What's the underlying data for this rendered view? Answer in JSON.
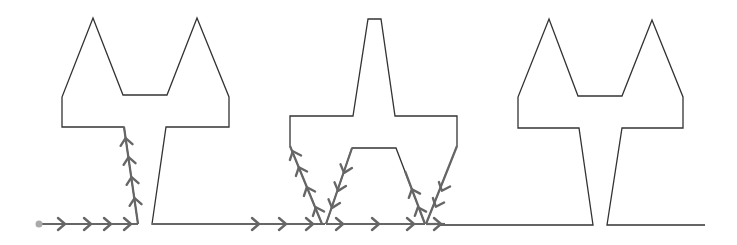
{
  "diagram": {
    "type": "path-through-shapes",
    "colors": {
      "outline": "#333333",
      "path": "#666666",
      "start_dot": "#aaaaaa",
      "background": "#ffffff"
    },
    "start_point": {
      "x": 39,
      "y": 224
    },
    "shapes": [
      {
        "name": "left-eared-shape",
        "points": "138,224 124,127 62,127 62,97 93,18 123,95 167,95 197,18 229,97 229,127 166,127 152,224 325,224"
      },
      {
        "name": "center-spire-shape",
        "points": "322,224 290,146 290,116 353,116 368,19 381,19 395,116 457,116 457,146 426,224",
        "inner": "326,224 352,148 396,148 425,224"
      },
      {
        "name": "right-eared-shape",
        "points": "440,225 593,225 579,128 518,128 518,97 549,19 578,96 622,96 652,20 683,97 683,128 622,128 607,225 705,225"
      }
    ],
    "path_segments": [
      {
        "from": [
          39,
          224
        ],
        "to": [
          138,
          224
        ]
      },
      {
        "from": [
          138,
          224
        ],
        "to": [
          124,
          127
        ]
      },
      {
        "from": [
          152,
          224
        ],
        "to": [
          322,
          224
        ]
      },
      {
        "from": [
          322,
          224
        ],
        "to": [
          290,
          146
        ]
      },
      {
        "from": [
          326,
          224
        ],
        "to": [
          425,
          224
        ]
      },
      {
        "from": [
          352,
          148
        ],
        "to": [
          326,
          224
        ]
      },
      {
        "from": [
          425,
          224
        ],
        "to": [
          405,
          171
        ]
      },
      {
        "from": [
          457,
          146
        ],
        "to": [
          426,
          224
        ]
      },
      {
        "from": [
          426,
          224
        ],
        "to": [
          445,
          224
        ]
      }
    ],
    "arrows": [
      {
        "x": 62,
        "y": 224,
        "angle": 0
      },
      {
        "x": 88,
        "y": 224,
        "angle": 0
      },
      {
        "x": 108,
        "y": 224,
        "angle": 0
      },
      {
        "x": 128,
        "y": 224,
        "angle": 0
      },
      {
        "x": 135,
        "y": 201,
        "angle": -98
      },
      {
        "x": 132,
        "y": 180,
        "angle": -98
      },
      {
        "x": 129,
        "y": 160,
        "angle": -98
      },
      {
        "x": 126,
        "y": 141,
        "angle": -98
      },
      {
        "x": 256,
        "y": 224,
        "angle": 0
      },
      {
        "x": 283,
        "y": 224,
        "angle": 0
      },
      {
        "x": 310,
        "y": 224,
        "angle": 0
      },
      {
        "x": 317,
        "y": 210,
        "angle": -112
      },
      {
        "x": 308,
        "y": 190,
        "angle": -112
      },
      {
        "x": 300,
        "y": 170,
        "angle": -112
      },
      {
        "x": 294,
        "y": 154,
        "angle": -112
      },
      {
        "x": 340,
        "y": 224,
        "angle": 0
      },
      {
        "x": 376,
        "y": 224,
        "angle": 0
      },
      {
        "x": 411,
        "y": 224,
        "angle": 0
      },
      {
        "x": 333,
        "y": 205,
        "angle": 108
      },
      {
        "x": 339,
        "y": 188,
        "angle": 108
      },
      {
        "x": 345,
        "y": 170,
        "angle": 108
      },
      {
        "x": 419,
        "y": 210,
        "angle": -111
      },
      {
        "x": 413,
        "y": 192,
        "angle": -111
      },
      {
        "x": 437,
        "y": 204,
        "angle": 112
      },
      {
        "x": 443,
        "y": 188,
        "angle": 112
      },
      {
        "x": 438,
        "y": 224,
        "angle": 0
      }
    ]
  }
}
